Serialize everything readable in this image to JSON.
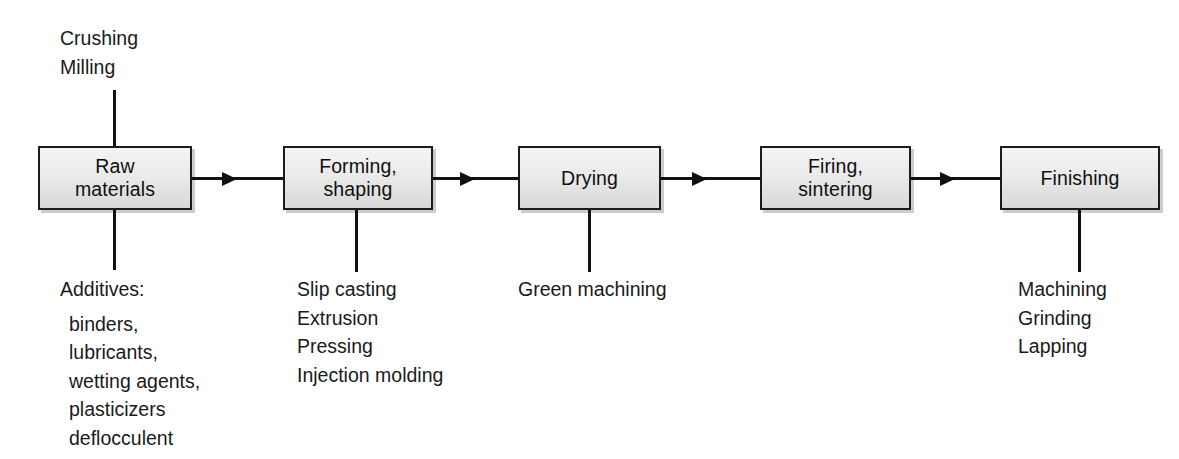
{
  "diagram": {
    "accent_color": "#111111",
    "box_fill_top": "#f4f4f4",
    "box_fill_bottom": "#d8d8d8",
    "box_border_color": "#1c1c1c"
  },
  "stages": [
    {
      "id": "raw-materials",
      "label": "Raw\nmaterials"
    },
    {
      "id": "forming-shaping",
      "label": "Forming,\nshaping"
    },
    {
      "id": "drying",
      "label": "Drying"
    },
    {
      "id": "firing-sintering",
      "label": "Firing,\nsintering"
    },
    {
      "id": "finishing",
      "label": "Finishing"
    }
  ],
  "above_labels": {
    "raw_materials": {
      "rows": [
        "Crushing",
        "Milling"
      ]
    }
  },
  "below_labels": {
    "raw_materials": {
      "heading": "Additives:",
      "rows": [
        "binders,",
        "lubricants,",
        "wetting agents,",
        "plasticizers",
        "deflocculent"
      ]
    },
    "forming_shaping": {
      "rows": [
        "Slip casting",
        "Extrusion",
        "Pressing",
        "Injection molding"
      ]
    },
    "drying": {
      "rows": [
        "Green machining"
      ]
    },
    "finishing": {
      "rows": [
        "Machining",
        "Grinding",
        "Lapping"
      ]
    }
  }
}
